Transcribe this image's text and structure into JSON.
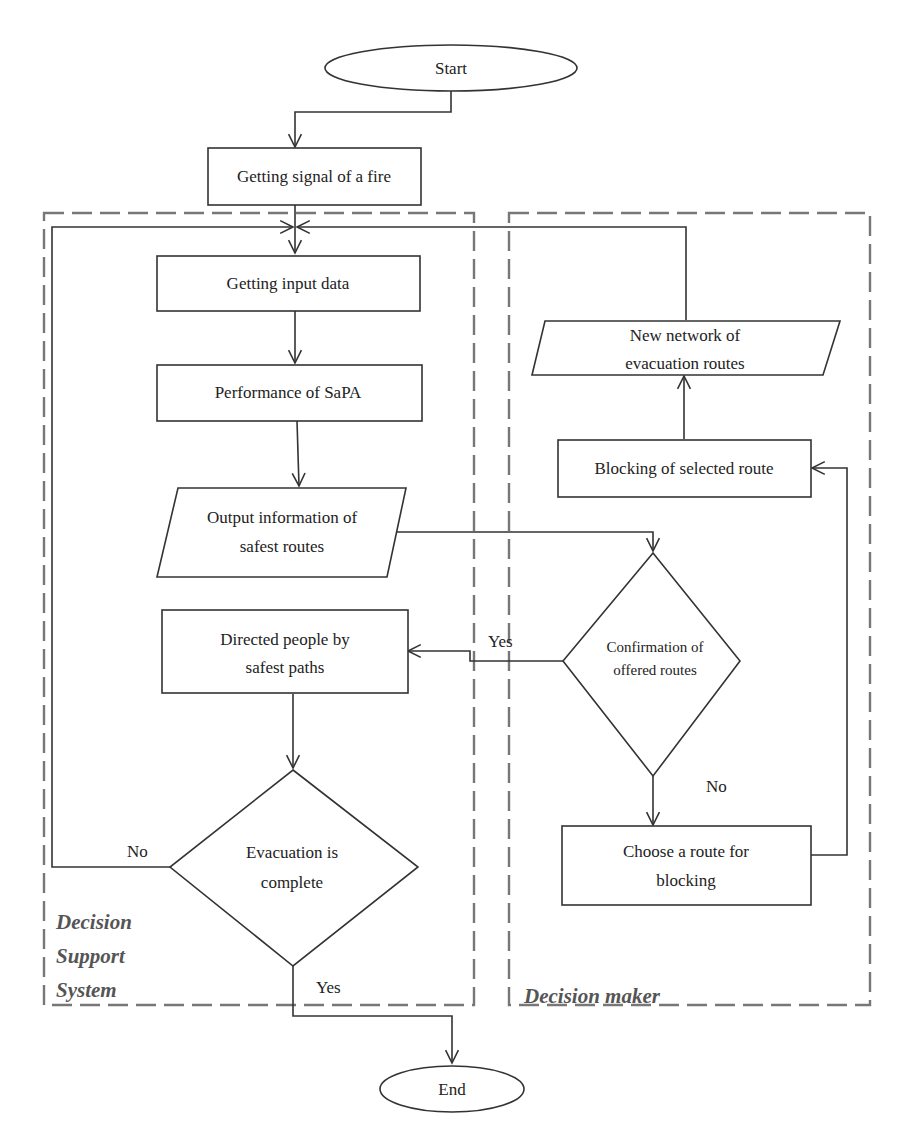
{
  "diagram": {
    "type": "flowchart",
    "groups": {
      "dss": {
        "label_lines": [
          "Decision",
          "Support",
          "System"
        ]
      },
      "dm": {
        "label": "Decision maker"
      }
    },
    "nodes": {
      "start": {
        "shape": "terminator",
        "label": "Start"
      },
      "signal": {
        "shape": "process",
        "label": "Getting signal of a fire"
      },
      "input": {
        "shape": "process",
        "label": "Getting input data"
      },
      "sapa": {
        "shape": "process",
        "label": "Performance of SaPA"
      },
      "output": {
        "shape": "data",
        "lines": [
          "Output information of",
          "safest routes"
        ]
      },
      "directed": {
        "shape": "process",
        "lines": [
          "Directed people by",
          "safest paths"
        ]
      },
      "evac": {
        "shape": "decision",
        "lines": [
          "Evacuation is",
          "complete"
        ]
      },
      "confirm": {
        "shape": "decision",
        "lines": [
          "Confirmation of",
          "offered routes"
        ]
      },
      "choose": {
        "shape": "process",
        "lines": [
          "Choose a route for",
          "blocking"
        ]
      },
      "blocking": {
        "shape": "process",
        "label": "Blocking of selected route"
      },
      "network": {
        "shape": "data",
        "lines": [
          "New network of",
          "evacuation routes"
        ]
      },
      "end": {
        "shape": "terminator",
        "label": "End"
      }
    },
    "edge_labels": {
      "confirm_yes": "Yes",
      "confirm_no": "No",
      "evac_no": "No",
      "evac_yes": "Yes"
    },
    "edges": [
      {
        "from": "start",
        "to": "signal"
      },
      {
        "from": "signal",
        "to": "input"
      },
      {
        "from": "input",
        "to": "sapa"
      },
      {
        "from": "sapa",
        "to": "output"
      },
      {
        "from": "output",
        "to": "confirm"
      },
      {
        "from": "confirm",
        "to": "directed",
        "label": "Yes"
      },
      {
        "from": "confirm",
        "to": "choose",
        "label": "No"
      },
      {
        "from": "choose",
        "to": "blocking"
      },
      {
        "from": "blocking",
        "to": "network"
      },
      {
        "from": "network",
        "to": "input"
      },
      {
        "from": "directed",
        "to": "evac"
      },
      {
        "from": "evac",
        "to": "input",
        "label": "No"
      },
      {
        "from": "evac",
        "to": "end",
        "label": "Yes"
      }
    ]
  }
}
